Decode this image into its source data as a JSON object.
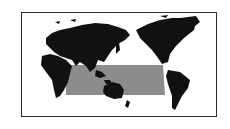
{
  "map": {
    "projection": "pacific-centered-world",
    "highlighted_region": "indo-pacific",
    "colors": {
      "land": "#111111",
      "highlight": "#8c8c8c",
      "frame": "#2a2a2a",
      "background": "#ffffff"
    }
  }
}
